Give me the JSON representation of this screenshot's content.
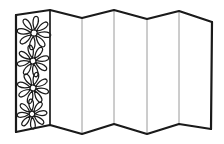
{
  "document": {
    "title": "Folding Screen Line Drawing",
    "kind": "black-and-white line art illustration",
    "background_color": "#ffffff",
    "outline_color": "#1a1a1a",
    "fold_line_color": "#9a9a9a",
    "fill_color": "#ffffff",
    "outline_width_px": 2.2,
    "fold_line_width_px": 1
  },
  "subject": {
    "name": "accordion-folded screen",
    "panel_count": 6,
    "decorated_panel_index": 0,
    "decoration": "daisy flowers",
    "flower_count": 4,
    "petals_per_flower": 8
  },
  "geometry": {
    "top_edge_points": "16,15 50,10 82,18 114,10 147,19 179,11 212,22",
    "bottom_edge_points": "16,132 50,125 82,134 114,124 147,134 179,124 211,129",
    "left_edge": {
      "x": 16,
      "y_top": 15,
      "y_bottom": 132
    },
    "right_edge": {
      "x": 212,
      "y_top": 22,
      "y_bottom": 129
    },
    "fold_lines": [
      {
        "x_top": 50,
        "y_top": 10,
        "x_bottom": 50,
        "y_bottom": 125
      },
      {
        "x_top": 82,
        "y_top": 18,
        "x_bottom": 82,
        "y_bottom": 134
      },
      {
        "x_top": 114,
        "y_top": 10,
        "x_bottom": 114,
        "y_bottom": 124
      },
      {
        "x_top": 147,
        "y_top": 19,
        "x_bottom": 147,
        "y_bottom": 134
      },
      {
        "x_top": 179,
        "y_top": 11,
        "x_bottom": 179,
        "y_bottom": 124
      }
    ],
    "flowers": [
      {
        "cx": 34,
        "cy": 33,
        "r_outer": 16,
        "r_inner": 3.2,
        "rotation": 8
      },
      {
        "cx": 33,
        "cy": 61,
        "r_outer": 15,
        "r_inner": 3.0,
        "rotation": -12
      },
      {
        "cx": 33,
        "cy": 88,
        "r_outer": 15,
        "r_inner": 3.0,
        "rotation": 15
      },
      {
        "cx": 32,
        "cy": 114,
        "r_outer": 14,
        "r_inner": 2.8,
        "rotation": -5
      }
    ]
  },
  "labels": {
    "alt_text": "Line drawing of a six-panel folding screen seen in perspective, the leftmost panel decorated with four daisy flowers"
  }
}
